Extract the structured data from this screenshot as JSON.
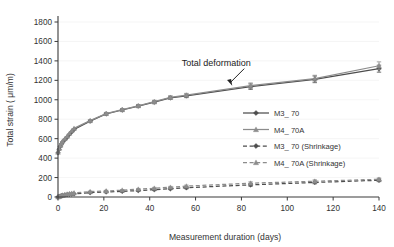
{
  "chart_data": {
    "type": "line",
    "title": "",
    "xlabel": "Measurement duration (days)",
    "ylabel": "Total strain ( μm/m)",
    "xlim": [
      0,
      140
    ],
    "ylim": [
      0,
      1800
    ],
    "xticks": [
      0,
      20,
      40,
      60,
      80,
      100,
      120,
      140
    ],
    "yticks": [
      0,
      200,
      400,
      600,
      800,
      1000,
      1200,
      1400,
      1600,
      1800
    ],
    "grid": "horizontal-faint",
    "legend_position": "center-right",
    "annotations": [
      {
        "text": "Total deformation",
        "x": 76,
        "y": 1125,
        "arrow": "points down-right to total deformation curve"
      }
    ],
    "x": [
      0,
      0.5,
      1,
      1.5,
      2,
      3,
      4,
      5,
      6,
      7,
      14,
      21,
      28,
      35,
      42,
      49,
      56,
      84,
      112,
      140
    ],
    "series": [
      {
        "name": "M3_ 70",
        "marker": "diamond",
        "linestyle": "solid",
        "color": "#4d4d4d",
        "values": [
          455,
          490,
          520,
          545,
          565,
          590,
          615,
          645,
          670,
          695,
          780,
          855,
          895,
          935,
          975,
          1020,
          1040,
          1135,
          1210,
          1320
        ],
        "errors": [
          0,
          0,
          0,
          0,
          0,
          0,
          0,
          0,
          0,
          0,
          10,
          12,
          12,
          14,
          15,
          16,
          18,
          28,
          34,
          36
        ]
      },
      {
        "name": "M4_ 70A",
        "marker": "triangle",
        "linestyle": "solid",
        "color": "#8c8c8c",
        "values": [
          460,
          500,
          530,
          555,
          575,
          600,
          625,
          655,
          682,
          706,
          785,
          858,
          898,
          938,
          980,
          1025,
          1048,
          1145,
          1218,
          1350
        ],
        "errors": [
          0,
          0,
          0,
          0,
          0,
          0,
          0,
          0,
          0,
          0,
          10,
          12,
          12,
          14,
          15,
          16,
          18,
          28,
          34,
          40
        ]
      },
      {
        "name": "M3_ 70 (Shrinkage)",
        "marker": "diamond",
        "linestyle": "dashed",
        "color": "#4d4d4d",
        "values": [
          0,
          4,
          8,
          12,
          16,
          20,
          24,
          28,
          30,
          33,
          45,
          52,
          58,
          66,
          75,
          85,
          95,
          125,
          150,
          172
        ],
        "errors": [
          0,
          0,
          0,
          0,
          0,
          0,
          0,
          0,
          0,
          0,
          6,
          7,
          7,
          8,
          9,
          9,
          10,
          14,
          14,
          14
        ]
      },
      {
        "name": "M4_ 70A (Shrinkage)",
        "marker": "triangle",
        "linestyle": "dashed",
        "color": "#8c8c8c",
        "values": [
          0,
          5,
          10,
          15,
          20,
          25,
          30,
          34,
          38,
          42,
          55,
          62,
          70,
          80,
          90,
          100,
          112,
          142,
          162,
          182
        ],
        "errors": [
          0,
          0,
          0,
          0,
          0,
          0,
          0,
          0,
          0,
          0,
          6,
          7,
          7,
          8,
          9,
          9,
          10,
          14,
          14,
          14
        ]
      }
    ]
  },
  "legend": {
    "items": [
      {
        "label": "M3_ 70"
      },
      {
        "label": "M4_ 70A"
      },
      {
        "label": "M3_ 70 (Shrinkage)"
      },
      {
        "label": "M4_ 70A (Shrinkage)"
      }
    ]
  },
  "colors": {
    "series_dark": "#4d4d4d",
    "series_light": "#8c8c8c",
    "axis": "#3a3a3a",
    "grid": "#efefef",
    "background": "#ffffff"
  }
}
